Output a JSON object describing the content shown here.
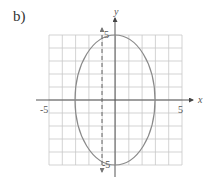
{
  "panel_label": "b)",
  "chart_data": {
    "type": "line",
    "title": "",
    "xlabel": "x",
    "ylabel": "y",
    "xlim": [
      -5,
      5
    ],
    "ylim": [
      -5,
      5
    ],
    "grid": true,
    "x_tick_labels": [
      "-5",
      "5"
    ],
    "y_tick_labels": [
      "5",
      "-5"
    ],
    "series": [
      {
        "name": "ellipse",
        "shape": "ellipse",
        "center": [
          0,
          0
        ],
        "semi_axis_x": 3,
        "semi_axis_y": 5,
        "style": "solid",
        "color": "#8a8a8a"
      },
      {
        "name": "vertical dashed line",
        "shape": "vertical_line",
        "x": -1,
        "style": "dashed",
        "arrows": "both",
        "color": "#666666"
      }
    ]
  },
  "colors": {
    "grid": "#c8c8c8",
    "axis": "#555555",
    "curve": "#8a8a8a",
    "dashed": "#666666"
  }
}
